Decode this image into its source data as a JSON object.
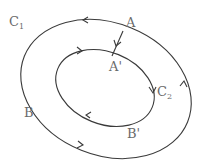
{
  "diagram": {
    "type": "two-concentric-loops",
    "curves": [
      {
        "id": "C1",
        "label": "C",
        "subscript": "1",
        "role": "outer loop",
        "direction": "counterclockwise"
      },
      {
        "id": "C2",
        "label": "C",
        "subscript": "2",
        "role": "inner loop",
        "direction": "clockwise"
      }
    ],
    "points": [
      {
        "id": "A",
        "label": "A",
        "on": "C1"
      },
      {
        "id": "A_prime",
        "label": "A'",
        "on": "C2"
      },
      {
        "id": "B",
        "label": "B",
        "on": "C1"
      },
      {
        "id": "B_prime",
        "label": "B'",
        "on": "C2"
      }
    ],
    "connector": {
      "from": "A",
      "to": "A_prime",
      "arrow": "toward A'"
    },
    "colors": {
      "stroke": "#3a3a3a",
      "label": "#6a6a6a",
      "background": "#ffffff"
    }
  }
}
